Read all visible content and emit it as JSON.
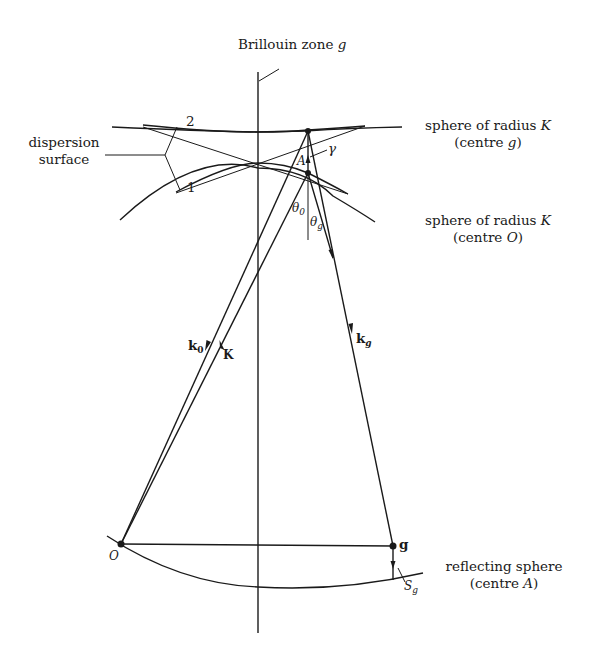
{
  "figure": {
    "title": "Brillouin zone g",
    "title_main": "Brillouin zone ",
    "title_var": "g",
    "labels": {
      "dispersion_surface_line1": "dispersion",
      "dispersion_surface_line2": "surface",
      "branch_1": "1",
      "branch_2": "2",
      "sphere_g_line1_text": "sphere of radius ",
      "sphere_g_line1_var": "K",
      "sphere_g_line2_text": "(centre ",
      "sphere_g_line2_var": "g",
      "sphere_g_line2_end": ")",
      "sphere_O_line1_text": "sphere of radius ",
      "sphere_O_line1_var": "K",
      "sphere_O_line2_text": "(centre ",
      "sphere_O_line2_var": "O",
      "sphere_O_line2_end": ")",
      "reflecting_line1": "reflecting sphere",
      "reflecting_line2_text": "(centre ",
      "reflecting_line2_var": "A",
      "reflecting_line2_end": ")",
      "point_A": "A",
      "point_O": "O",
      "point_g": "g",
      "gamma": "γ",
      "theta_0": "θ",
      "theta_0_sub": "0",
      "theta_g": "θ",
      "theta_g_sub": "g",
      "vec_k0": "k",
      "vec_k0_sub": "0",
      "vec_K": "K",
      "vec_kg": "k",
      "vec_kg_sub": "g",
      "S_g": "S",
      "S_g_sub": "g"
    },
    "colors": {
      "ink": "#1a1a1a",
      "background": "#ffffff"
    }
  }
}
